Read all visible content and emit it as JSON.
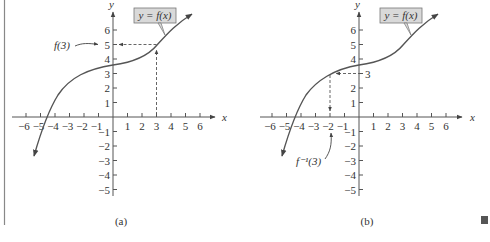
{
  "figure": {
    "end_marker_color": "#555555",
    "curve_color": "#555555",
    "label_box_fill": "#d9d9d9",
    "panels": [
      {
        "id": "a",
        "caption": "(a)",
        "curve_label": "y = f(x)",
        "x_axis_label": "x",
        "y_axis_label": "y",
        "x_ticks": [
          "−6",
          "−5",
          "−4",
          "−3",
          "−2",
          "−1",
          "1",
          "2",
          "3",
          "4",
          "5",
          "6"
        ],
        "y_ticks": [
          "6",
          "5",
          "4",
          "3",
          "2",
          "1",
          "−1",
          "−2",
          "−3",
          "−4",
          "−5"
        ],
        "annotation": "f(3)",
        "annotation_meaning": "input x = 3 maps to output y = 5"
      },
      {
        "id": "b",
        "caption": "(b)",
        "curve_label": "y = f(x)",
        "x_axis_label": "x",
        "y_axis_label": "y",
        "x_ticks": [
          "−6",
          "−5",
          "−4",
          "−3",
          "−2",
          "−1",
          "1",
          "2",
          "3",
          "4",
          "5",
          "6"
        ],
        "y_ticks": [
          "6",
          "5",
          "4",
          "−3",
          "2",
          "1",
          "−1",
          "−2",
          "−3",
          "−4",
          "−5"
        ],
        "y_marker_label": "3",
        "annotation": "f⁻¹(3)",
        "annotation_meaning": "output y = 3 maps back to input x = −2"
      }
    ]
  }
}
